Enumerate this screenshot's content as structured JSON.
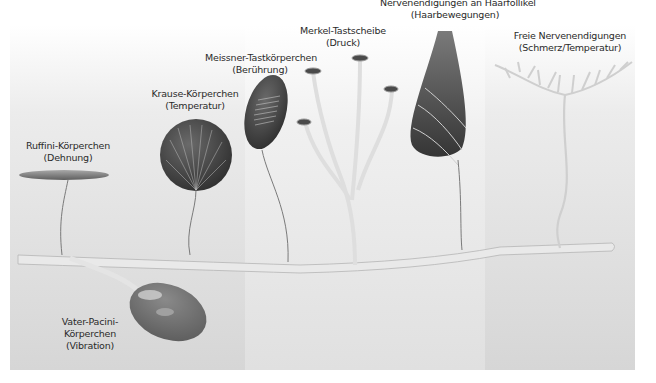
{
  "diagram": {
    "type": "skin-receptors",
    "colors": {
      "background_light": "#f2f2f2",
      "panel_mid": "#d9d9d9",
      "panel_dark": "#cfcfcf",
      "nerve": "#e6e6e6",
      "receptor_dark": "#3c3c3c",
      "text": "#2a2a2a"
    },
    "receptors": [
      {
        "name": "Ruffini-Körperchen",
        "function": "(Dehnung)"
      },
      {
        "name": "Krause-Körperchen",
        "function": "(Temperatur)"
      },
      {
        "name": "Meissner-Tastkörperchen",
        "function": "(Berührung)"
      },
      {
        "name": "Merkel-Tastscheibe",
        "function": "(Druck)"
      },
      {
        "name": "Nervenendigungen an Haarfollikel",
        "function": "(Haarbewegungen)"
      },
      {
        "name": "Freie Nervenendigungen",
        "function": "(Schmerz/Temperatur)"
      },
      {
        "name_line1": "Vater-Pacini-",
        "name_line2": "Körperchen",
        "function": "(Vibration)"
      }
    ]
  }
}
